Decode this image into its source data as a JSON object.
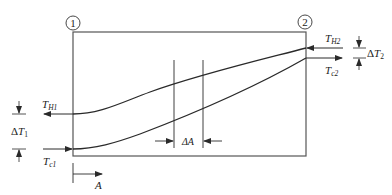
{
  "diagram": {
    "title": "",
    "stations": [
      {
        "id": "1",
        "label": "1",
        "cx": 73,
        "cy": 23
      },
      {
        "id": "2",
        "label": "2",
        "cx": 305,
        "cy": 22
      }
    ],
    "box": {
      "x": 73,
      "y": 32,
      "width": 233,
      "height": 124
    },
    "curves": {
      "hot": {
        "name": "hot-fluid-temperature",
        "start": [
          73,
          114
        ],
        "end": [
          306,
          48
        ]
      },
      "cold": {
        "name": "cold-fluid-temperature",
        "start": [
          73,
          149
        ],
        "end": [
          306,
          58
        ]
      }
    },
    "labels": {
      "TH1_main": "T",
      "TH1_sub": "H1",
      "Tc1_main": "T",
      "Tc1_sub": "c1",
      "TH2_main": "T",
      "TH2_sub": "H2",
      "Tc2_main": "T",
      "Tc2_sub": "c2",
      "dT1_delta": "Δ",
      "dT1_main": "T",
      "dT1_sub": "1",
      "dT2_delta": "Δ",
      "dT2_main": "T",
      "dT2_sub": "2",
      "dA": "ΔA",
      "A": "A"
    },
    "stroke_color": "#2a2a2a",
    "box_color": "#555555"
  }
}
